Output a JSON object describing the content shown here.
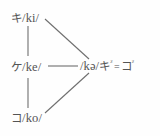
{
  "figure": {
    "background_color": "#fefefe",
    "ink_color": "#545454",
    "line_color": "#6e6e6e"
  },
  "nodes": {
    "ki": {
      "kana": "キ",
      "ipa": "/ki/",
      "full": "キ/ki/"
    },
    "ke": {
      "kana": "ケ",
      "ipa": "/ke/",
      "full": "ケ/ke/"
    },
    "ko": {
      "kana": "コ",
      "ipa": "/ko/",
      "full": "コ/ko/"
    },
    "ka": {
      "ipa": "/kə/",
      "gloss_kana_1": "キ",
      "gloss_sup_1": "ᶻ",
      "equals": "=",
      "gloss_kana_2": "コ",
      "gloss_sup_2": "ᶻ",
      "full": "/kə/キᶻ=コᶻ"
    }
  },
  "edges": [
    {
      "name": "ki-to-ke",
      "from": "ki",
      "to": "ke",
      "kind": "vertical"
    },
    {
      "name": "ke-to-ko",
      "from": "ke",
      "to": "ko",
      "kind": "vertical"
    },
    {
      "name": "ki-to-ka",
      "from": "ki",
      "to": "ka",
      "kind": "diagonal-down"
    },
    {
      "name": "ke-to-ka",
      "from": "ke",
      "to": "ka",
      "kind": "horizontal"
    },
    {
      "name": "ko-to-ka",
      "from": "ko",
      "to": "ka",
      "kind": "diagonal-up"
    }
  ]
}
